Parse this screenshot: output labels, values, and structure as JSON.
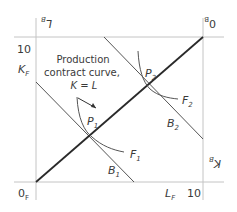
{
  "diagram": {
    "type": "edgeworth-box",
    "corners": {
      "origin_F": {
        "text": "0",
        "sub": "F"
      },
      "origin_B": {
        "text": "0",
        "sub": "B"
      }
    },
    "axis_labels": {
      "K_F": {
        "text": "K",
        "sub": "F"
      },
      "L_F": {
        "text": "L",
        "sub": "F"
      },
      "K_B": {
        "text": "K",
        "sub": "B"
      },
      "L_B": {
        "text": "L",
        "sub": "B"
      }
    },
    "tick_labels": {
      "left_top": "10",
      "bottom_right": "10"
    },
    "contract_curve_label": {
      "line1": "Production",
      "line2": "contract curve,",
      "line3": "K = L"
    },
    "points": [
      {
        "text": "P",
        "sub": "1"
      },
      {
        "text": "P",
        "sub": "2"
      }
    ],
    "isoquants_F": [
      {
        "text": "F",
        "sub": "1"
      },
      {
        "text": "F",
        "sub": "2"
      }
    ],
    "isoquants_B": [
      {
        "text": "B",
        "sub": "1"
      },
      {
        "text": "B",
        "sub": "2"
      }
    ],
    "colors": {
      "box": "#bdbdbd",
      "contract_curve": "#2a2a2a",
      "lines": "#555555",
      "text": "#3a3a3a"
    }
  }
}
